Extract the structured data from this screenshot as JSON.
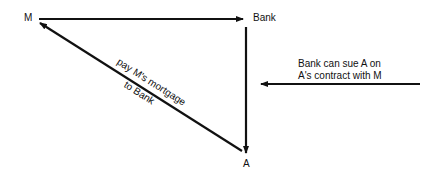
{
  "nodes": {
    "m": {
      "label": "M"
    },
    "bank": {
      "label": "Bank"
    },
    "a": {
      "label": "A"
    }
  },
  "edges": {
    "m_to_bank": {
      "from": "M",
      "to": "Bank",
      "label": ""
    },
    "bank_to_a": {
      "from": "Bank",
      "to": "A",
      "label": ""
    },
    "a_to_m": {
      "from": "A",
      "to": "M",
      "label_line1": "pay M's mortgage",
      "label_line2": "to Bank"
    },
    "external_to_a": {
      "label_line1": "Bank can sue A on",
      "label_line2": "A's contract with M"
    }
  },
  "colors": {
    "stroke": "#111111",
    "background": "#ffffff"
  }
}
